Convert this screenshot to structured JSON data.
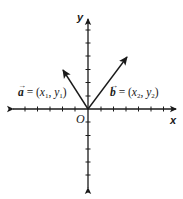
{
  "diagram": {
    "type": "coordinate-plane-vectors",
    "colors": {
      "ink": "#1a1a1a",
      "background": "#ffffff"
    },
    "axes": {
      "x_label": "x",
      "y_label": "y",
      "origin_label": "O"
    },
    "vectors": [
      {
        "id": "a",
        "name": "a",
        "arrow": "→",
        "eq": " = (",
        "x_var": "x",
        "x_sub": "1",
        "sep": ", ",
        "y_var": "y",
        "y_sub": "1",
        "close": ")",
        "direction": "up-left"
      },
      {
        "id": "b",
        "name": "b",
        "arrow": "→",
        "eq": " = (",
        "x_var": "x",
        "x_sub": "2",
        "sep": ", ",
        "y_var": "y",
        "y_sub": "2",
        "close": ")",
        "direction": "up-right"
      }
    ]
  }
}
